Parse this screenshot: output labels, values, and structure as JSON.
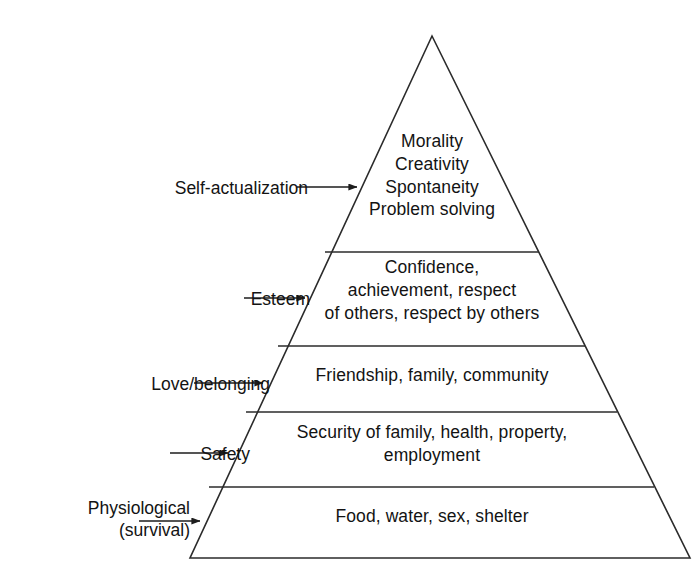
{
  "diagram": {
    "type": "pyramid",
    "line_color": "#2b2b2b",
    "fill_color": "#ffffff",
    "text_color": "#131313",
    "levels": [
      {
        "id": "self-actualization",
        "label": "Self-actualization",
        "rank": 5,
        "content": "Morality\nCreativity\nSpontaneity\nProblem solving",
        "items": [
          "Morality",
          "Creativity",
          "Spontaneity",
          "Problem solving"
        ]
      },
      {
        "id": "esteem",
        "label": "Esteem",
        "rank": 4,
        "content": "Confidence,\nachievement, respect\nof others, respect by others",
        "items": [
          "Confidence",
          "achievement",
          "respect of others",
          "respect by others"
        ]
      },
      {
        "id": "love-belonging",
        "label": "Love/belonging",
        "rank": 3,
        "content": "Friendship, family, community",
        "items": [
          "Friendship",
          "family",
          "community"
        ]
      },
      {
        "id": "safety",
        "label": "Safety",
        "rank": 2,
        "content": "Security of family, health, property,\nemployment",
        "items": [
          "Security of family",
          "health",
          "property",
          "employment"
        ]
      },
      {
        "id": "physiological",
        "label": "Physiological\n(survival)",
        "rank": 1,
        "content": "Food, water, sex, shelter",
        "items": [
          "Food",
          "water",
          "sex",
          "shelter"
        ]
      }
    ]
  }
}
